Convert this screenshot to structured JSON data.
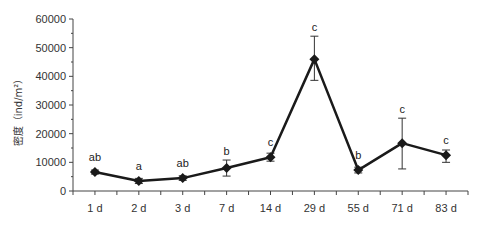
{
  "chart_data": {
    "type": "line",
    "title": "",
    "xlabel": "",
    "ylabel": "密度（ind/m²）",
    "ylim": [
      0,
      60000
    ],
    "yticks": [
      0,
      10000,
      20000,
      30000,
      40000,
      50000,
      60000
    ],
    "ytick_labels": [
      "0",
      "10000",
      "20000",
      "30000",
      "40000",
      "50000",
      "60000"
    ],
    "grid": false,
    "legend": null,
    "categories": [
      "1 d",
      "2 d",
      "3 d",
      "7 d",
      "14 d",
      "29 d",
      "55 d",
      "71 d",
      "83 d"
    ],
    "series": [
      {
        "name": "密度",
        "values": [
          6600,
          3500,
          4500,
          8000,
          11800,
          46000,
          7300,
          16700,
          12500
        ],
        "error_upper": [
          7300,
          4400,
          5300,
          10800,
          13200,
          54000,
          8300,
          25400,
          14300
        ],
        "error_lower": [
          5900,
          2600,
          3700,
          5200,
          10400,
          38600,
          6300,
          7700,
          10000
        ],
        "significance_labels": [
          "ab",
          "a",
          "ab",
          "b",
          "c",
          "c",
          "b",
          "c",
          "c"
        ],
        "color": "#1a1a1a",
        "marker": "diamond"
      }
    ]
  }
}
